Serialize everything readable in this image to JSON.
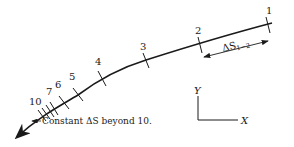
{
  "figure": {
    "type": "path-discretization-diagram",
    "curve": {
      "points": [
        [
          272,
          23
        ],
        [
          240,
          31
        ],
        [
          200,
          44
        ],
        [
          146,
          60
        ],
        [
          102,
          79
        ],
        [
          78,
          95
        ],
        [
          64,
          103
        ],
        [
          54,
          109
        ],
        [
          42,
          116
        ],
        [
          30,
          125
        ],
        [
          17,
          137
        ]
      ],
      "color": "#1a1a1a"
    },
    "stations": [
      {
        "label": "1",
        "x": 268,
        "y": 25,
        "lx": 268,
        "ly": 14
      },
      {
        "label": "2",
        "x": 200,
        "y": 44,
        "lx": 198,
        "ly": 34
      },
      {
        "label": "3",
        "x": 146,
        "y": 60,
        "lx": 144,
        "ly": 50
      },
      {
        "label": "4",
        "x": 102,
        "y": 78,
        "lx": 98,
        "ly": 65
      },
      {
        "label": "5",
        "x": 78,
        "y": 94,
        "lx": 72,
        "ly": 79
      },
      {
        "label": "6",
        "x": 64,
        "y": 102,
        "lx": 58,
        "ly": 87
      },
      {
        "label": "7",
        "x": 54,
        "y": 108,
        "lx": 50,
        "ly": 94
      },
      {
        "label": "10",
        "x": 42,
        "y": 115,
        "lx": 34,
        "ly": 104
      }
    ],
    "extra_ticks_between_7_and_10": 2,
    "delta_label": {
      "main": "ΔS",
      "sub": "1−2"
    },
    "note": "Constant ΔS beyond 10.",
    "axes": {
      "x_label": "X",
      "y_label": "Y"
    }
  }
}
